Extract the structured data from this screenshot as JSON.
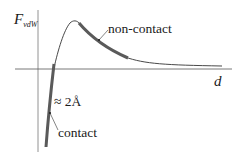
{
  "figure": {
    "y_axis_label": "F",
    "y_axis_subscript": "vdW",
    "x_axis_label": "d",
    "annotations": {
      "non_contact": "non-contact",
      "contact": "contact",
      "distance": "≈ 2Å"
    },
    "colors": {
      "axis": "#555555",
      "curve": "#333333",
      "highlight": "#555555",
      "text": "#1a1a1a"
    }
  }
}
